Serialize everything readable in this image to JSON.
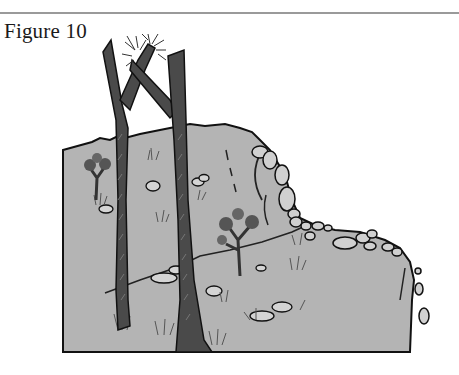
{
  "figure": {
    "caption": "Figure 10",
    "number": 10,
    "illustration": {
      "description": "Grayscale drawing of a rocky hillside slope with two tall dark tree trunks, small shrubs, grass tufts, scattered stones and a crumbling rock wall on the right",
      "colors": {
        "ground": "#b4b4b4",
        "trunk": "#4a4a4a",
        "outline": "#111111",
        "stone": "#d0d0d0",
        "rule": "#9a9a9a"
      }
    }
  }
}
